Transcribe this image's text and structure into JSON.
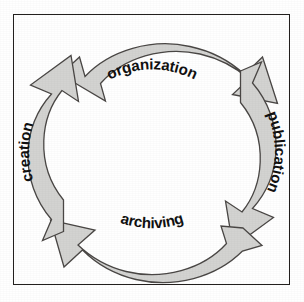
{
  "diagram": {
    "type": "cyclical-process-diagram",
    "title_visible": false,
    "direction": "clockwise",
    "border_color": "#23201e",
    "background_color": "#ffffff",
    "arrow_fill_color": "#d3d3d1",
    "arrow_outline_color": "#4a4745",
    "label_color": "#111111",
    "stages": [
      {
        "id": "organization",
        "label": "organization",
        "position": "top",
        "order": 1,
        "text_orientation": "curved-along-arc"
      },
      {
        "id": "publication",
        "label": "publication",
        "position": "right",
        "order": 2,
        "text_orientation": "rotated-downward"
      },
      {
        "id": "archiving",
        "label": "archiving",
        "position": "bottom",
        "order": 3,
        "text_orientation": "curved-along-arc"
      },
      {
        "id": "creation",
        "label": "creation",
        "position": "left",
        "order": 4,
        "text_orientation": "rotated-upward"
      }
    ]
  }
}
